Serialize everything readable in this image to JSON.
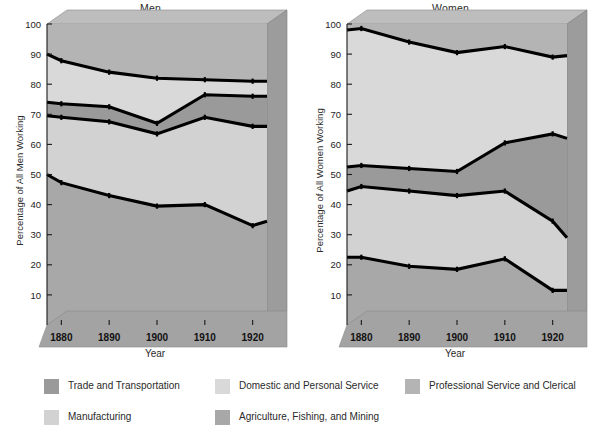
{
  "figure": {
    "background": "#ffffff",
    "line_color": "#000000",
    "axis_text_color": "#1d1d1d"
  },
  "panels": [
    {
      "key": "men",
      "title": "Men",
      "ylabel": "Percentage of All Men Working",
      "xlabel": "Year"
    },
    {
      "key": "women",
      "title": "Women",
      "ylabel": "Percentage of All Women Working",
      "xlabel": "Year"
    }
  ],
  "legend": {
    "items": [
      {
        "label": "Trade and Transportation",
        "color": "#9a9a9a"
      },
      {
        "label": "Manufacturing",
        "color": "#d2d2d2"
      },
      {
        "label": "Domestic and Personal Service",
        "color": "#d9d9d9"
      },
      {
        "label": "Agriculture, Fishing, and Mining",
        "color": "#a8a8a8"
      },
      {
        "label": "Professional Service and Clerical",
        "color": "#b4b4b4"
      }
    ]
  },
  "chart_data": {
    "type": "area",
    "xlabel": "Year",
    "grid": false,
    "legend_position": "bottom",
    "x": [
      1877,
      1880,
      1890,
      1900,
      1910,
      1920,
      1923
    ],
    "xlim": [
      1877,
      1923
    ],
    "ylim": [
      0,
      100
    ],
    "xticks": [
      1880,
      1890,
      1900,
      1910,
      1920
    ],
    "yticks": [
      10,
      20,
      30,
      40,
      50,
      60,
      70,
      80,
      90,
      100
    ],
    "xtick_labels": [
      "1880",
      "1890",
      "1900",
      "1910",
      "1920"
    ],
    "ytick_labels": [
      "10",
      "20",
      "30",
      "40",
      "50",
      "60",
      "70",
      "80",
      "90",
      "100"
    ],
    "stack_order_bottom_to_top": [
      "Agriculture, Fishing, and Mining",
      "Manufacturing",
      "Trade and Transportation",
      "Domestic and Personal Service",
      "Professional Service and Clerical"
    ],
    "panels": [
      {
        "name": "Men",
        "ylabel": "Percentage of All Men Working",
        "ylim": [
          0,
          100
        ],
        "cumulative_boundaries": [
          {
            "name": "Agriculture, Fishing, and Mining",
            "values": [
              50.0,
              47.3,
              43.0,
              39.5,
              40.0,
              33.0,
              34.5
            ]
          },
          {
            "name": "Manufacturing",
            "values": [
              69.5,
              69.0,
              67.5,
              63.5,
              69.0,
              66.0,
              66.0
            ]
          },
          {
            "name": "Trade and Transportation",
            "values": [
              74.0,
              73.5,
              72.5,
              67.0,
              76.5,
              76.0,
              76.0
            ]
          },
          {
            "name": "Domestic and Personal Service",
            "values": [
              90.0,
              87.8,
              84.0,
              82.0,
              81.5,
              81.0,
              81.0
            ]
          },
          {
            "name": "Professional Service and Clerical",
            "values": [
              100.0,
              100.0,
              100.0,
              100.0,
              100.0,
              100.0,
              100.0
            ]
          }
        ],
        "series_thickness": [
          {
            "name": "Agriculture, Fishing, and Mining",
            "values": [
              50.0,
              47.3,
              43.0,
              39.5,
              40.0,
              33.0,
              34.5
            ]
          },
          {
            "name": "Manufacturing",
            "values": [
              19.5,
              21.7,
              24.5,
              24.0,
              29.0,
              33.0,
              31.5
            ]
          },
          {
            "name": "Trade and Transportation",
            "values": [
              4.5,
              4.5,
              5.0,
              3.5,
              7.5,
              10.0,
              10.0
            ]
          },
          {
            "name": "Domestic and Personal Service",
            "values": [
              16.0,
              14.3,
              11.5,
              15.0,
              5.0,
              5.0,
              5.0
            ]
          },
          {
            "name": "Professional Service and Clerical",
            "values": [
              10.0,
              12.2,
              16.0,
              18.0,
              18.5,
              19.0,
              19.0
            ]
          }
        ]
      },
      {
        "name": "Women",
        "ylabel": "Percentage of All Women Working",
        "ylim": [
          0,
          100
        ],
        "cumulative_boundaries": [
          {
            "name": "Agriculture, Fishing, and Mining",
            "values": [
              22.5,
              22.5,
              19.5,
              18.5,
              22.0,
              11.5,
              11.5
            ]
          },
          {
            "name": "Manufacturing",
            "values": [
              44.5,
              46.0,
              44.5,
              43.0,
              44.5,
              34.5,
              29.0
            ]
          },
          {
            "name": "Trade and Transportation",
            "values": [
              52.5,
              53.0,
              52.0,
              51.0,
              60.5,
              63.5,
              62.0
            ]
          },
          {
            "name": "Domestic and Personal Service",
            "values": [
              98.0,
              98.5,
              94.0,
              90.5,
              92.5,
              89.0,
              89.5
            ]
          },
          {
            "name": "Professional Service and Clerical",
            "values": [
              100.0,
              100.0,
              100.0,
              100.0,
              100.0,
              100.0,
              100.0
            ]
          }
        ],
        "series_thickness": [
          {
            "name": "Agriculture, Fishing, and Mining",
            "values": [
              22.5,
              22.5,
              19.5,
              18.5,
              22.0,
              11.5,
              11.5
            ]
          },
          {
            "name": "Manufacturing",
            "values": [
              22.0,
              23.5,
              25.0,
              24.5,
              22.5,
              23.0,
              17.5
            ]
          },
          {
            "name": "Trade and Transportation",
            "values": [
              8.0,
              7.0,
              7.5,
              8.0,
              16.0,
              29.0,
              33.0
            ]
          },
          {
            "name": "Domestic and Personal Service",
            "values": [
              45.5,
              45.5,
              42.0,
              39.5,
              32.0,
              25.5,
              27.5
            ]
          },
          {
            "name": "Professional Service and Clerical",
            "values": [
              2.0,
              1.5,
              6.0,
              9.5,
              7.5,
              11.0,
              10.5
            ]
          }
        ]
      }
    ]
  }
}
